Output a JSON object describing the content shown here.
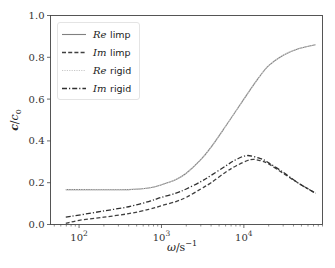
{
  "chart_data": {
    "type": "line",
    "title": "",
    "xlabel": "ω/s⁻¹",
    "ylabel": "c/c₀",
    "xscale": "log",
    "xlim": [
      45,
      90000
    ],
    "ylim": [
      0.0,
      1.0
    ],
    "grid": false,
    "legend_position": "upper left",
    "x_ticks": [
      {
        "value": 100,
        "label_base": "10",
        "label_exp": "2"
      },
      {
        "value": 1000,
        "label_base": "10",
        "label_exp": "3"
      },
      {
        "value": 10000,
        "label_base": "10",
        "label_exp": "4"
      }
    ],
    "y_ticks": [
      {
        "value": 0.0,
        "label": "0.0"
      },
      {
        "value": 0.2,
        "label": "0.2"
      },
      {
        "value": 0.4,
        "label": "0.4"
      },
      {
        "value": 0.6,
        "label": "0.6"
      },
      {
        "value": 0.8,
        "label": "0.8"
      },
      {
        "value": 1.0,
        "label": "1.0"
      }
    ],
    "series": [
      {
        "name": "Re limp",
        "label_math": "Re",
        "label_text": "limp",
        "style": "solid",
        "color": "#808080",
        "x": [
          69,
          100,
          200,
          400,
          700,
          1000,
          1500,
          2000,
          3000,
          4000,
          6000,
          10000,
          15000,
          20000,
          30000,
          45000,
          74000
        ],
        "y": [
          0.167,
          0.167,
          0.166,
          0.167,
          0.175,
          0.19,
          0.215,
          0.245,
          0.31,
          0.37,
          0.47,
          0.6,
          0.7,
          0.76,
          0.81,
          0.84,
          0.86
        ]
      },
      {
        "name": "Im limp",
        "label_math": "Im",
        "label_text": "limp",
        "style": "dashed",
        "color": "#404040",
        "x": [
          69,
          100,
          200,
          400,
          700,
          1000,
          1500,
          2000,
          3000,
          4000,
          6000,
          8000,
          12000,
          16000,
          20000,
          30000,
          45000,
          74000
        ],
        "y": [
          0.005,
          0.02,
          0.035,
          0.052,
          0.072,
          0.09,
          0.11,
          0.13,
          0.17,
          0.2,
          0.25,
          0.28,
          0.31,
          0.305,
          0.29,
          0.245,
          0.2,
          0.15
        ]
      },
      {
        "name": "Re rigid",
        "label_math": "Re",
        "label_text": "rigid",
        "style": "dotted",
        "color": "#c8c8c8",
        "x": [
          69,
          100,
          200,
          400,
          700,
          1000,
          1500,
          2000,
          3000,
          4000,
          6000,
          10000,
          15000,
          20000,
          30000,
          45000,
          74000
        ],
        "y": [
          0.167,
          0.167,
          0.166,
          0.167,
          0.175,
          0.19,
          0.215,
          0.245,
          0.31,
          0.37,
          0.47,
          0.6,
          0.7,
          0.76,
          0.81,
          0.84,
          0.86
        ]
      },
      {
        "name": "Im rigid",
        "label_math": "Im",
        "label_text": "rigid",
        "style": "dashdot",
        "color": "#303030",
        "x": [
          69,
          100,
          200,
          400,
          700,
          1000,
          1500,
          2000,
          3000,
          4000,
          6000,
          8000,
          11000,
          16000,
          20000,
          30000,
          45000,
          74000
        ],
        "y": [
          0.035,
          0.045,
          0.065,
          0.085,
          0.11,
          0.13,
          0.15,
          0.17,
          0.205,
          0.235,
          0.28,
          0.31,
          0.33,
          0.315,
          0.295,
          0.25,
          0.2,
          0.15
        ]
      }
    ]
  }
}
